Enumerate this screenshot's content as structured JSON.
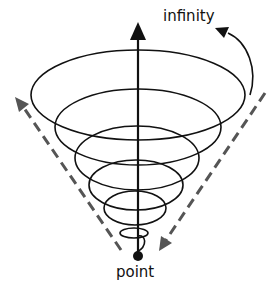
{
  "diagram": {
    "type": "spiral-vortex",
    "labels": {
      "top": "infinity",
      "bottom": "point"
    },
    "elements": {
      "axis": "vertical solid arrow from point upward to infinity",
      "spiral": "conical helix widening upward from point",
      "curved_arrow": "solid curved arrow from outermost ring toward infinity",
      "left_dashed_arrow": "dashed arrow pointing up-left away from point",
      "right_dashed_arrow": "dashed arrow pointing down-left toward point"
    },
    "colors": {
      "line": "#111111",
      "dashed": "#555555",
      "background": "#ffffff"
    }
  }
}
